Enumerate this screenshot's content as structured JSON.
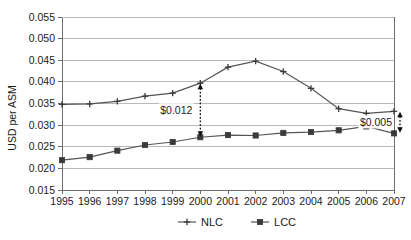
{
  "chart_data": {
    "type": "line",
    "title": "",
    "xlabel": "",
    "ylabel": "USD per ASM",
    "categories": [
      "1995",
      "1996",
      "1997",
      "1998",
      "1999",
      "2000",
      "2001",
      "2002",
      "2003",
      "2004",
      "2005",
      "2006",
      "2007"
    ],
    "x": [
      1995,
      1996,
      1997,
      1998,
      1999,
      2000,
      2001,
      2002,
      2003,
      2004,
      2005,
      2006,
      2007
    ],
    "series": [
      {
        "name": "NLC",
        "marker": "cross",
        "values": [
          0.0348,
          0.0349,
          0.0355,
          0.0367,
          0.0374,
          0.0397,
          0.0434,
          0.0448,
          0.0424,
          0.0385,
          0.0338,
          0.0327,
          0.0332
        ]
      },
      {
        "name": "LCC",
        "marker": "square",
        "values": [
          0.0219,
          0.0226,
          0.0241,
          0.0254,
          0.0261,
          0.0272,
          0.0277,
          0.0276,
          0.0282,
          0.0284,
          0.0288,
          0.0297,
          0.0281
        ]
      }
    ],
    "ylim": [
      0.015,
      0.055
    ],
    "ytick_step": 0.005,
    "ytick_labels": [
      "0.055",
      "0.050",
      "0.045",
      "0.040",
      "0.035",
      "0.030",
      "0.025",
      "0.020",
      "0.015"
    ],
    "ytick_values": [
      0.055,
      0.05,
      0.045,
      0.04,
      0.035,
      0.03,
      0.025,
      0.02,
      0.015
    ],
    "grid": true,
    "legend_position": "bottom",
    "annotations": [
      {
        "label": "$0.012",
        "at_year": 2000,
        "from_value": 0.0397,
        "to_value": 0.0272,
        "style": "double-arrow-dotted",
        "label_side": "left"
      },
      {
        "label": "$0.005",
        "at_year": 2007,
        "from_value": 0.0332,
        "to_value": 0.0281,
        "style": "double-arrow-dotted",
        "label_side": "left"
      }
    ]
  },
  "legend": {
    "items": [
      {
        "label": "NLC",
        "marker": "cross"
      },
      {
        "label": "LCC",
        "marker": "square"
      }
    ]
  },
  "colors": {
    "series_line": "#555555",
    "marker": "#3a3a3a",
    "gridline": "#b9b9b9",
    "axis": "#6d6d6d",
    "text": "#1a1a1a",
    "background": "#ffffff"
  }
}
